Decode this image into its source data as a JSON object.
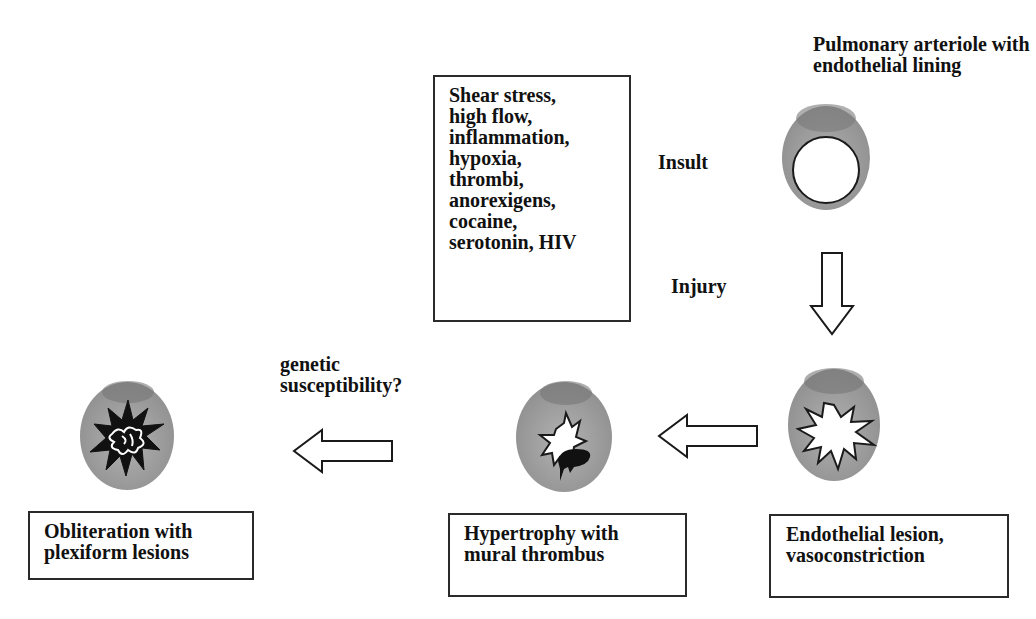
{
  "diagram": {
    "title_label": "Pulmonary arteriole with\nendothelial lining",
    "insult_label": "Insult",
    "injury_label": "Injury",
    "genetic_label": "genetic\nsusceptibility?",
    "insult_factors_box": {
      "text": "Shear stress,\nhigh flow,\ninflammation,\nhypoxia,\nthrombi,\nanorexigens,\ncocaine,\nserotonin, HIV",
      "items": [
        "Shear stress",
        "high flow",
        "inflammation",
        "hypoxia",
        "thrombi",
        "anorexigens",
        "cocaine",
        "serotonin",
        "HIV"
      ]
    },
    "stages": [
      {
        "id": "normal",
        "icon": "normal-arteriole-icon",
        "caption": ""
      },
      {
        "id": "endothelial-lesion",
        "icon": "endothelial-lesion-vessel-icon",
        "caption": "Endothelial lesion,\nvasoconstriction"
      },
      {
        "id": "hypertrophy",
        "icon": "hypertrophy-thrombus-vessel-icon",
        "caption": "Hypertrophy with\nmural thrombus"
      },
      {
        "id": "obliteration",
        "icon": "plexiform-lesion-vessel-icon",
        "caption": "Obliteration with\nplexiform lesions"
      }
    ],
    "arrows": [
      {
        "from": "normal",
        "to": "endothelial-lesion",
        "direction": "down"
      },
      {
        "from": "endothelial-lesion",
        "to": "hypertrophy",
        "direction": "left"
      },
      {
        "from": "hypertrophy",
        "to": "obliteration",
        "direction": "left"
      }
    ],
    "colors": {
      "vessel_wall": "#9a9a9a",
      "vessel_wall_dark": "#7c7c7c",
      "lumen": "#ffffff",
      "outline": "#1a1a1a",
      "thrombus": "#111111"
    }
  }
}
